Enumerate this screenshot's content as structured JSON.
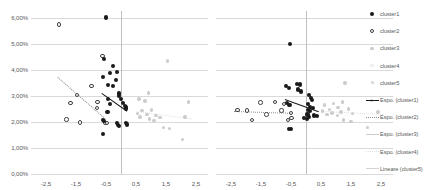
{
  "chart_data": [
    {
      "id": "left",
      "type": "scatter",
      "title": "",
      "xlabel": "",
      "ylabel": "",
      "xlim": [
        -3.0,
        2.9
      ],
      "ylim": [
        0.0,
        0.0625
      ],
      "grid": true,
      "xticks": [
        "-2,5",
        "-1,5",
        "-0,5",
        "0,5",
        "1,5",
        "2,5"
      ],
      "xtick_values": [
        -2.5,
        -1.5,
        -0.5,
        0.5,
        1.5,
        2.5
      ],
      "yticks": [
        "0,00%",
        "1,00%",
        "2,00%",
        "3,00%",
        "4,00%",
        "5,00%",
        "6,00%"
      ],
      "ytick_values": [
        0.0,
        0.01,
        0.02,
        0.03,
        0.04,
        0.05,
        0.06
      ],
      "series": [
        {
          "name": "cluster1",
          "marker": "filled-dark",
          "points": [
            [
              -0.5,
              0.06
            ],
            [
              -0.58,
              0.044
            ],
            [
              -0.6,
              0.0373
            ],
            [
              -0.26,
              0.0415
            ],
            [
              -0.36,
              0.0386
            ],
            [
              -0.12,
              0.0391
            ],
            [
              -0.16,
              0.036
            ],
            [
              -0.44,
              0.034
            ],
            [
              -0.28,
              0.0337
            ],
            [
              -0.08,
              0.0312
            ],
            [
              -0.07,
              0.0306
            ],
            [
              -0.06,
              0.0299
            ],
            [
              -0.42,
              0.0288
            ],
            [
              -0.38,
              0.0267
            ],
            [
              0.0,
              0.0286
            ],
            [
              0.08,
              0.0271
            ],
            [
              0.12,
              0.0262
            ],
            [
              0.16,
              0.0255
            ],
            [
              0.18,
              0.0248
            ],
            [
              -0.45,
              0.0238
            ],
            [
              -0.6,
              0.0207
            ],
            [
              -0.57,
              0.0202
            ],
            [
              -0.13,
              0.0196
            ],
            [
              -0.1,
              0.0188
            ],
            [
              -0.08,
              0.0184
            ],
            [
              0.16,
              0.0194
            ],
            [
              0.2,
              0.019
            ],
            [
              -0.6,
              0.0152
            ]
          ]
        },
        {
          "name": "cluster2",
          "marker": "open",
          "points": [
            [
              -2.07,
              0.0573
            ],
            [
              -0.62,
              0.0453
            ],
            [
              -0.98,
              0.0337
            ],
            [
              -1.46,
              0.0302
            ],
            [
              -1.68,
              0.0273
            ],
            [
              -0.78,
              0.0276
            ],
            [
              -0.8,
              0.0252
            ],
            [
              -1.82,
              0.0209
            ],
            [
              -1.36,
              0.0197
            ],
            [
              -0.52,
              0.0195
            ],
            [
              -0.47,
              0.0195
            ]
          ]
        },
        {
          "name": "cluster3",
          "marker": "filled-light",
          "points": [
            [
              1.55,
              0.0434
            ],
            [
              0.92,
              0.031
            ],
            [
              0.6,
              0.0288
            ],
            [
              0.8,
              0.028
            ],
            [
              2.25,
              0.0277
            ],
            [
              1.02,
              0.0246
            ],
            [
              0.7,
              0.0243
            ],
            [
              0.55,
              0.0232
            ],
            [
              0.86,
              0.0228
            ],
            [
              1.16,
              0.0225
            ],
            [
              0.63,
              0.0219
            ],
            [
              1.3,
              0.0217
            ],
            [
              2.13,
              0.0219
            ],
            [
              0.95,
              0.0211
            ],
            [
              1.1,
              0.0205
            ],
            [
              1.42,
              0.0178
            ],
            [
              1.62,
              0.0175
            ],
            [
              2.05,
              0.0132
            ]
          ]
        },
        {
          "name": "cluster4",
          "marker": "open-light",
          "points": []
        },
        {
          "name": "cluster5",
          "marker": "filled-pale",
          "points": []
        }
      ],
      "trendlines": [
        {
          "name": "Espo. (cluster1)",
          "style": "solid-dark",
          "x1": -0.62,
          "y1": 0.031,
          "x2": 0.22,
          "y2": 0.0242
        },
        {
          "name": "Espo. (cluster2)",
          "style": "dotted-gray",
          "x1": -2.1,
          "y1": 0.0372,
          "x2": -0.52,
          "y2": 0.0214
        },
        {
          "name": "Espo. (cluster3)",
          "style": "dotted-pale",
          "x1": 0.52,
          "y1": 0.0243,
          "x2": 2.35,
          "y2": 0.0214
        }
      ]
    },
    {
      "id": "right",
      "type": "scatter",
      "title": "",
      "xlabel": "",
      "ylabel": "",
      "xlim": [
        -3.0,
        2.9
      ],
      "ylim": [
        0.0,
        0.0625
      ],
      "grid": true,
      "xticks": [
        "-2,5",
        "-1,5",
        "-0,5",
        "0,5",
        "1,5",
        "2,5"
      ],
      "xtick_values": [
        -2.5,
        -1.5,
        -0.5,
        0.5,
        1.5,
        2.5
      ],
      "yticks": [],
      "ytick_values": [
        0.0,
        0.01,
        0.02,
        0.03,
        0.04,
        0.05,
        0.06
      ],
      "series": [
        {
          "name": "cluster1",
          "marker": "filled-dark",
          "points": [
            [
              -0.52,
              0.05
            ],
            [
              -0.66,
              0.0338
            ],
            [
              -0.58,
              0.033
            ],
            [
              -0.3,
              0.0345
            ],
            [
              -0.2,
              0.0343
            ],
            [
              -0.26,
              0.0324
            ],
            [
              -0.18,
              0.0316
            ],
            [
              0.1,
              0.0303
            ],
            [
              0.16,
              0.0292
            ],
            [
              0.2,
              0.0285
            ],
            [
              -0.62,
              0.0272
            ],
            [
              -0.55,
              0.0265
            ],
            [
              0.08,
              0.0268
            ],
            [
              0.14,
              0.0258
            ],
            [
              0.22,
              0.0252
            ],
            [
              0.06,
              0.0246
            ],
            [
              0.12,
              0.024
            ],
            [
              0.05,
              0.0228
            ],
            [
              0.09,
              0.022
            ],
            [
              0.28,
              0.0224
            ],
            [
              0.36,
              0.0222
            ],
            [
              -0.07,
              0.0216
            ],
            [
              0.02,
              0.021
            ],
            [
              -0.56,
              0.0174
            ],
            [
              -0.5,
              0.0172
            ]
          ]
        },
        {
          "name": "cluster2",
          "marker": "open",
          "points": [
            [
              -1.52,
              0.0274
            ],
            [
              -1.04,
              0.0275
            ],
            [
              -0.73,
              0.0268
            ],
            [
              -2.28,
              0.0245
            ],
            [
              -1.96,
              0.0243
            ],
            [
              -0.82,
              0.0243
            ],
            [
              -1.32,
              0.0228
            ],
            [
              -0.5,
              0.0234
            ],
            [
              -1.8,
              0.0208
            ],
            [
              -0.6,
              0.0206
            ],
            [
              -0.48,
              0.0214
            ]
          ]
        },
        {
          "name": "cluster3",
          "marker": "filled-light",
          "points": [
            [
              1.3,
              0.0348
            ],
            [
              2.18,
              0.0282
            ],
            [
              1.22,
              0.0276
            ],
            [
              0.92,
              0.027
            ],
            [
              0.62,
              0.0264
            ],
            [
              1.06,
              0.0255
            ],
            [
              1.42,
              0.025
            ],
            [
              0.78,
              0.0248
            ],
            [
              0.55,
              0.0242
            ],
            [
              1.16,
              0.0238
            ],
            [
              0.86,
              0.0234
            ],
            [
              1.55,
              0.0232
            ],
            [
              2.4,
              0.0238
            ],
            [
              0.7,
              0.0228
            ],
            [
              1.05,
              0.0224
            ],
            [
              1.25,
              0.0206
            ],
            [
              1.5,
              0.0202
            ],
            [
              2.05,
              0.0178
            ]
          ]
        },
        {
          "name": "cluster4",
          "marker": "open-light",
          "points": []
        },
        {
          "name": "cluster5",
          "marker": "filled-pale",
          "points": []
        }
      ],
      "trendlines": [
        {
          "name": "Espo. (cluster1)",
          "style": "solid-dark",
          "x1": -0.7,
          "y1": 0.0286,
          "x2": 0.44,
          "y2": 0.0238
        },
        {
          "name": "Espo. (cluster2)",
          "style": "dotted-gray",
          "x1": -2.4,
          "y1": 0.0243,
          "x2": -0.46,
          "y2": 0.0236
        },
        {
          "name": "Espo. (cluster3)",
          "style": "dotted-pale",
          "x1": 0.5,
          "y1": 0.0243,
          "x2": 2.55,
          "y2": 0.0232
        }
      ]
    }
  ],
  "legend": {
    "position": "right",
    "items": [
      {
        "label": "cluster1",
        "glyph": "filled-dark",
        "kind": "marker"
      },
      {
        "label": "cluster2",
        "glyph": "open",
        "kind": "marker"
      },
      {
        "label": "cluster3",
        "glyph": "filled-light",
        "kind": "marker"
      },
      {
        "label": "cluster4",
        "glyph": "open-light",
        "kind": "marker"
      },
      {
        "label": "cluster5",
        "glyph": "filled-pale",
        "kind": "marker"
      },
      {
        "label": "Espo. (cluster1)",
        "glyph": "solid-dark",
        "kind": "line"
      },
      {
        "label": "Espo. (cluster2)",
        "glyph": "dotted-gray",
        "kind": "line"
      },
      {
        "label": "Espo. (cluster3)",
        "glyph": "solid-light",
        "kind": "line"
      },
      {
        "label": "Espo. (cluster4)",
        "glyph": "dotted-pale",
        "kind": "line"
      },
      {
        "label": "Lineare (cluster5)",
        "glyph": "solid-pale",
        "kind": "line"
      }
    ]
  },
  "colors": {
    "grid": "#d9d9d9",
    "axis": "#bfbfbf",
    "text": "#595959",
    "cluster1": "#1a1a1a",
    "cluster2": "#404040",
    "cluster3": "#cccccc",
    "cluster4": "#e0e0e0",
    "cluster5": "#d4d4d4",
    "background": "#ffffff"
  }
}
